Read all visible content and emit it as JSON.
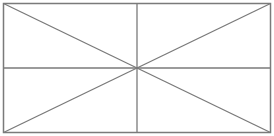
{
  "figure": {
    "kind": "placeholder-frame",
    "width": 274,
    "height": 136,
    "background": "#ffffff",
    "stroke_color": "#7a7a7a",
    "frame": {
      "x1": 3.5,
      "y1": 3.5,
      "x2": 270.5,
      "y2": 132.5
    },
    "center": {
      "x": 137,
      "y": 68
    },
    "lines": [
      {
        "name": "diagonal-tl-br",
        "x1": 3.5,
        "y1": 3.5,
        "x2": 270.5,
        "y2": 132.5
      },
      {
        "name": "diagonal-bl-tr",
        "x1": 3.5,
        "y1": 132.5,
        "x2": 270.5,
        "y2": 3.5
      },
      {
        "name": "vertical-midline",
        "x1": 137,
        "y1": 3.5,
        "x2": 137,
        "y2": 132.5
      },
      {
        "name": "horizontal-midline",
        "x1": 3.5,
        "y1": 68,
        "x2": 270.5,
        "y2": 68
      }
    ]
  }
}
